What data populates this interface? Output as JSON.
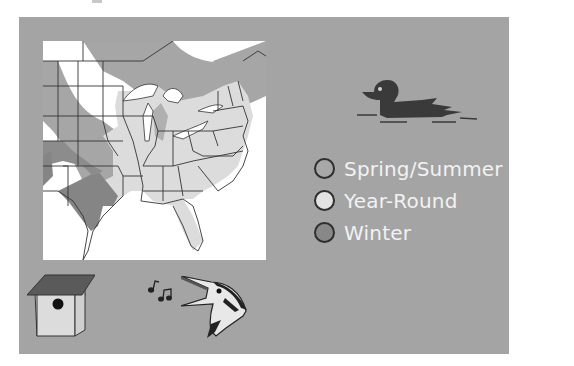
{
  "panel": {
    "background": "#a4a4a4"
  },
  "map": {
    "region": "Eastern United States",
    "colors": {
      "spring_summer": "#a6a6a6",
      "year_round": "#dcdcdc",
      "winter": "#858585",
      "outside": "#ffffff",
      "borders": "#333333"
    }
  },
  "legend": {
    "items": [
      {
        "label": "Spring/Summer",
        "color": "#a8a8a8"
      },
      {
        "label": "Year-Round",
        "color": "#e2e2e2"
      },
      {
        "label": "Winter",
        "color": "#888888"
      }
    ]
  },
  "icons": {
    "duck": "duck-silhouette",
    "birdhouse": "birdhouse-nest-box",
    "notes": "music-notes",
    "bird": "singing-bird-head"
  }
}
